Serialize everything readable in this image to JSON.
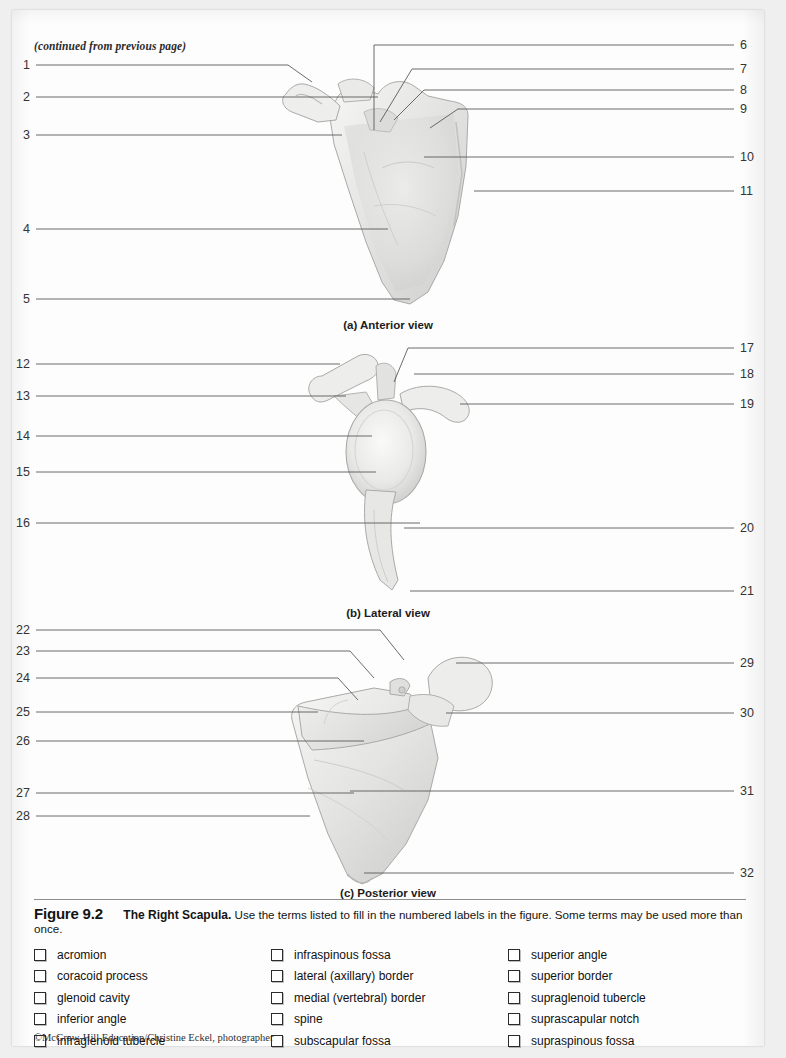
{
  "page": {
    "continued_note": "(continued from previous page)",
    "credit": "©McGraw-Hill Education/Christine Eckel, photographer"
  },
  "figure": {
    "number": "Figure 9.2",
    "title": "The Right Scapula.",
    "instruction": "Use the terms listed to fill in the numbered labels in the figure. Some terms may be used more than once."
  },
  "panels": [
    {
      "id": "a",
      "caption": "(a) Anterior view",
      "left_labels": [
        "1",
        "2",
        "3",
        "4",
        "5"
      ],
      "right_labels": [
        "6",
        "7",
        "8",
        "9",
        "10",
        "11"
      ]
    },
    {
      "id": "b",
      "caption": "(b) Lateral view",
      "left_labels": [
        "12",
        "13",
        "14",
        "15",
        "16"
      ],
      "right_labels": [
        "17",
        "18",
        "19",
        "20",
        "21"
      ]
    },
    {
      "id": "c",
      "caption": "(c) Posterior view",
      "left_labels": [
        "22",
        "23",
        "24",
        "25",
        "26",
        "27",
        "28"
      ],
      "right_labels": [
        "29",
        "30",
        "31",
        "32"
      ]
    }
  ],
  "term_columns": [
    [
      "acromion",
      "coracoid process",
      "glenoid cavity",
      "inferior angle",
      "infraglenoid tubercle"
    ],
    [
      "infraspinous fossa",
      "lateral (axillary) border",
      "medial (vertebral) border",
      "spine",
      "subscapular fossa"
    ],
    [
      "superior angle",
      "superior border",
      "supraglenoid tubercle",
      "suprascapular notch",
      "supraspinous fossa"
    ]
  ],
  "colors": {
    "page_background": "#efefef",
    "sheet": "#fdfdfd",
    "leader_line": "#5a5a5a",
    "bone_light": "#f2f2f0",
    "bone_mid": "#dcdcda",
    "bone_shadow": "#bdbdbb",
    "text": "#141414"
  }
}
